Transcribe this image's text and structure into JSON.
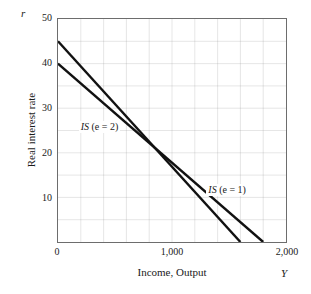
{
  "chart_data": {
    "type": "line",
    "title": "",
    "xlabel": "Income, Output",
    "ylabel": "Real interest rate",
    "x_axis_symbol": "Y",
    "y_axis_symbol": "r",
    "xlim": [
      0,
      2000
    ],
    "ylim": [
      0,
      50
    ],
    "grid": true,
    "grid_x_step": 200,
    "grid_y_step": 5,
    "xticks": [
      {
        "value": 0,
        "label": "0"
      },
      {
        "value": 1000,
        "label": "1,000"
      },
      {
        "value": 2000,
        "label": "2,000"
      }
    ],
    "yticks": [
      {
        "value": 50,
        "label": "50"
      },
      {
        "value": 40,
        "label": "40"
      },
      {
        "value": 30,
        "label": "30"
      },
      {
        "value": 20,
        "label": "20"
      },
      {
        "value": 10,
        "label": "10"
      }
    ],
    "legend_position": "inline-annotations",
    "series": [
      {
        "name": "IS (e = 2)",
        "label_html_prefix": "IS",
        "label_html_suffix": " (e = 2)",
        "color": "#111111",
        "width": 2.4,
        "points": [
          [
            0,
            45
          ],
          [
            1600,
            0
          ]
        ],
        "annotation": {
          "x": 180,
          "y": 26
        }
      },
      {
        "name": "IS (e = 1)",
        "label_html_prefix": "IS",
        "label_html_suffix": " (e = 1)",
        "color": "#111111",
        "width": 2.4,
        "points": [
          [
            0,
            40
          ],
          [
            1800,
            0
          ]
        ],
        "annotation": {
          "x": 1290,
          "y": 12
        }
      }
    ]
  },
  "figure": {
    "y_axis_symbol": "r",
    "x_axis_symbol": "Y",
    "y_title": "Real interest rate",
    "x_title": "Income, Output",
    "ytick_labels": [
      "50",
      "40",
      "30",
      "20",
      "10"
    ],
    "xtick_labels": [
      "0",
      "1,000",
      "2,000"
    ],
    "curve1_is": "IS",
    "curve1_paren": "(e = 2)",
    "curve2_is": "IS",
    "curve2_paren": "(e = 1)",
    "colors": {
      "curve": "#111111",
      "grid": "#8a8a8a",
      "frame": "#6d6d6d",
      "background": "#ffffff"
    }
  }
}
